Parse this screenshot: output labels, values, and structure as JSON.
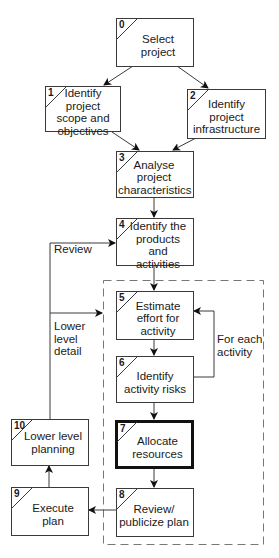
{
  "diagram": {
    "type": "flowchart",
    "steps": [
      {
        "num": "0",
        "label": "Select project"
      },
      {
        "num": "1",
        "label": "Identify project scope and objectives"
      },
      {
        "num": "2",
        "label": "Identify project infrastructure"
      },
      {
        "num": "3",
        "label": "Analyse project characteristics"
      },
      {
        "num": "4",
        "label": "Identify the products and activities"
      },
      {
        "num": "5",
        "label": "Estimate effort for activity"
      },
      {
        "num": "6",
        "label": "Identify activity risks"
      },
      {
        "num": "7",
        "label": "Allocate resources",
        "emphasized": true
      },
      {
        "num": "8",
        "label": "Review/ publicize plan"
      },
      {
        "num": "9",
        "label": "Execute plan"
      },
      {
        "num": "10",
        "label": "Lower level planning"
      }
    ],
    "edge_labels": {
      "review": "Review",
      "lower_level_detail": "Lower level detail",
      "for_each_activity": "For each activity"
    },
    "colors": {
      "line": "#3a3a3a",
      "dashed_border": "#777777",
      "highlight_border": "#111111"
    }
  }
}
